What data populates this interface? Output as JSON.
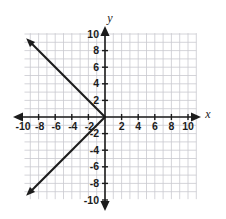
{
  "figure": {
    "width": 226,
    "height": 219,
    "background_color": "#ffffff",
    "grid_color": "#c9c9cf",
    "axis_color": "#1c1c1c",
    "line_color": "#1c1c1c"
  },
  "axes": {
    "x_axis_label": "x",
    "y_axis_label": "y",
    "x_tick_labels_negative": [
      "-10",
      "-8",
      "-6",
      "-4",
      "-2"
    ],
    "x_tick_labels_positive": [
      "2",
      "4",
      "6",
      "8",
      "10"
    ],
    "y_tick_labels_positive": [
      "10",
      "8",
      "6",
      "4",
      "2"
    ],
    "y_tick_labels_negative": [
      "-2",
      "-4",
      "-6",
      "-8",
      "-10"
    ],
    "x_tick_values_negative": [
      -10,
      -8,
      -6,
      -4,
      -2
    ],
    "x_tick_values_positive": [
      2,
      4,
      6,
      8,
      10
    ],
    "y_tick_values_positive": [
      10,
      8,
      6,
      4,
      2
    ],
    "y_tick_values_negative": [
      -2,
      -4,
      -6,
      -8,
      -10
    ]
  },
  "chart_data": {
    "type": "line",
    "title": "",
    "xlabel": "x",
    "ylabel": "y",
    "xlim": [
      -11,
      11
    ],
    "ylim": [
      -11,
      11
    ],
    "xticks": [
      -10,
      -8,
      -6,
      -4,
      -2,
      2,
      4,
      6,
      8,
      10
    ],
    "yticks": [
      -10,
      -8,
      -6,
      -4,
      -2,
      2,
      4,
      6,
      8,
      10
    ],
    "grid": true,
    "grid_step": 1,
    "legend": null,
    "equation": "x = -|y|",
    "series": [
      {
        "name": "upper-ray",
        "equation": "y = -x for x <= 0",
        "slope": -1,
        "points": [
          [
            0,
            0
          ],
          [
            -9.5,
            9.5
          ]
        ],
        "arrow_at_end": true
      },
      {
        "name": "lower-ray",
        "equation": "y = x for x <= 0",
        "slope": 1,
        "points": [
          [
            0,
            0
          ],
          [
            -9.5,
            -9.5
          ]
        ],
        "arrow_at_end": true
      }
    ]
  }
}
